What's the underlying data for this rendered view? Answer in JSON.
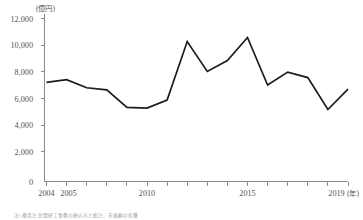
{
  "chart_data": {
    "type": "line",
    "title": "",
    "xlabel": "",
    "ylabel": "",
    "x_unit": "(年)",
    "y_unit": "(億円)",
    "x": [
      2004,
      2005,
      2006,
      2007,
      2008,
      2009,
      2010,
      2011,
      2012,
      2013,
      2014,
      2015,
      2016,
      2017,
      2018,
      2019
    ],
    "values": [
      7300,
      7500,
      6900,
      6750,
      5450,
      5400,
      6000,
      10300,
      8100,
      8900,
      10600,
      7100,
      8050,
      7650,
      5300,
      6800
    ],
    "series": [
      {
        "name": "",
        "values": [
          7300,
          7500,
          6900,
          6750,
          5450,
          5400,
          6000,
          10300,
          8100,
          8900,
          10600,
          7100,
          8050,
          7650,
          5300,
          6800
        ]
      }
    ],
    "xlim": [
      2004,
      2019
    ],
    "ylim": [
      0,
      12000
    ],
    "ytick_values": [
      0,
      2000,
      4000,
      6000,
      8000,
      10000,
      12000
    ],
    "ytick_labels": [
      "0",
      "2,000",
      "4,000",
      "6,000",
      "8,000",
      "10,000",
      "12,000"
    ],
    "xtick_values": [
      2004,
      2005,
      2006,
      2007,
      2008,
      2009,
      2010,
      2011,
      2012,
      2013,
      2014,
      2015,
      2016,
      2017,
      2018,
      2019
    ],
    "xtick_labels_shown": [
      "2004",
      "2005",
      "2010",
      "2015",
      "2019"
    ],
    "grid": false,
    "legend": false,
    "legend_position": "none",
    "line_color": "#1c1c1c",
    "axis_color": "#8a8a8a",
    "text_color": "#545454"
  },
  "labels": {
    "y_unit": "(億円)",
    "x_unit": "(年)",
    "y_12000": "12,000",
    "y_10000": "10,000",
    "y_8000": "8,000",
    "y_6000": "6,000",
    "y_4000": "4,000",
    "y_2000": "2,000",
    "y_0": "0",
    "x_2004": "2004",
    "x_2005": "2005",
    "x_2010": "2010",
    "x_2015": "2015",
    "x_2019": "2019"
  },
  "caption": {
    "source_note": "注) 構造計 民間研工事費の総のみと統計、市価額の各種"
  }
}
